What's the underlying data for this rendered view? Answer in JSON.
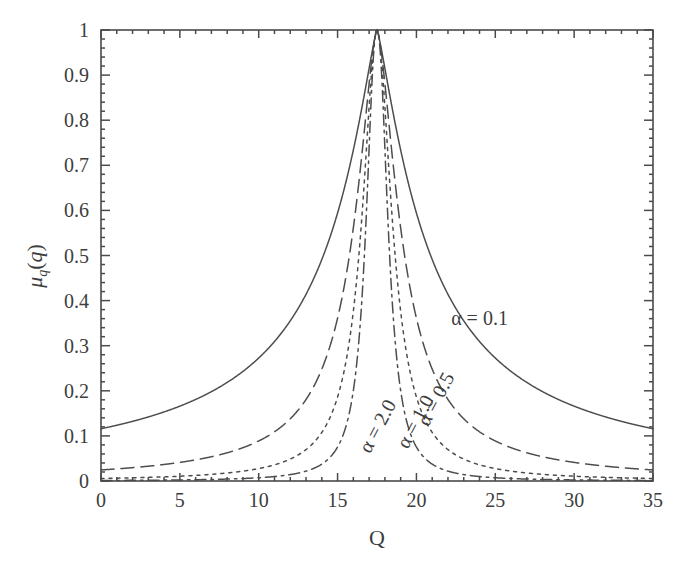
{
  "figure": {
    "background_color": "#ffffff",
    "line_color": "#4d4d4d",
    "axis_color": "#4a4a4a",
    "text_color": "#3d3d3d"
  },
  "chart_data": {
    "type": "line",
    "title": "",
    "subtitle": "",
    "xlabel": "Q",
    "ylabel": "μₐ(q)",
    "ylabel_display": "μ_q(q)",
    "xlim": [
      0,
      35
    ],
    "ylim": [
      0,
      1
    ],
    "grid": false,
    "legend_position": "inline-annotations",
    "xticks": [
      0,
      5,
      10,
      15,
      20,
      25,
      30,
      35
    ],
    "xtick_labels": [
      "0",
      "5",
      "10",
      "15",
      "20",
      "25",
      "30",
      "35"
    ],
    "xminor_step": 1,
    "yticks": [
      0,
      0.1,
      0.2,
      0.3,
      0.4,
      0.5,
      0.6,
      0.7,
      0.8,
      0.9,
      1
    ],
    "ytick_labels": [
      "0",
      "0.1",
      "0.2",
      "0.3",
      "0.4",
      "0.5",
      "0.6",
      "0.7",
      "0.8",
      "0.9",
      "1"
    ],
    "yminor_step": 0.02,
    "peak_x": 17.5,
    "function": "mu_q(Q) = 1 / (1 + ((Q - c) / w)^(2*alpha_exp))",
    "series": [
      {
        "name": "α = 0.1",
        "alpha": 0.1,
        "center": 17.5,
        "halfwidth": 3.4,
        "shape_exponent": 0.62,
        "linestyle": "solid",
        "dasharray": "",
        "label": "α = 0.1",
        "label_x": 24.0,
        "label_y": 0.345,
        "label_rotation": 0,
        "points_x": [
          0,
          1,
          2,
          3,
          4,
          5,
          6,
          7,
          8,
          9,
          10,
          11,
          12,
          13,
          14,
          15,
          16,
          17,
          17.5,
          18,
          19,
          20,
          21,
          22,
          23,
          24,
          25,
          26,
          27,
          28,
          29,
          30,
          31,
          32,
          33,
          34,
          35
        ],
        "points_y": [
          0.037,
          0.04,
          0.044,
          0.048,
          0.053,
          0.059,
          0.066,
          0.075,
          0.086,
          0.101,
          0.12,
          0.147,
          0.185,
          0.244,
          0.338,
          0.49,
          0.718,
          0.944,
          1.0,
          0.944,
          0.718,
          0.49,
          0.338,
          0.244,
          0.185,
          0.147,
          0.12,
          0.101,
          0.086,
          0.075,
          0.066,
          0.059,
          0.053,
          0.048,
          0.044,
          0.04,
          0.037
        ]
      },
      {
        "name": "α = 0.5",
        "alpha": 0.5,
        "center": 17.5,
        "halfwidth": 1.75,
        "shape_exponent": 0.8,
        "linestyle": "dashed",
        "dasharray": "13,7",
        "label": "α = 0.5",
        "label_x": 21.6,
        "label_y": 0.175,
        "label_rotation": -62,
        "points_x": [
          0,
          2,
          4,
          6,
          8,
          10,
          11,
          12,
          13,
          14,
          15,
          16,
          17,
          17.5,
          18,
          19,
          20,
          21,
          22,
          23,
          24,
          25,
          27,
          29,
          31,
          33,
          35
        ],
        "points_y": [
          0.006,
          0.007,
          0.009,
          0.011,
          0.015,
          0.023,
          0.029,
          0.039,
          0.055,
          0.083,
          0.139,
          0.266,
          0.62,
          1.0,
          0.62,
          0.266,
          0.139,
          0.083,
          0.055,
          0.039,
          0.029,
          0.023,
          0.015,
          0.011,
          0.009,
          0.007,
          0.006
        ]
      },
      {
        "name": "α = 1.0",
        "alpha": 1.0,
        "center": 17.5,
        "halfwidth": 1.15,
        "shape_exponent": 0.95,
        "linestyle": "dotted",
        "dasharray": "3,5",
        "label": "α = 1.0",
        "label_x": 20.3,
        "label_y": 0.125,
        "label_rotation": -62,
        "points_x": [
          0,
          3,
          6,
          9,
          12,
          13,
          14,
          15,
          16,
          17,
          17.5,
          18,
          19,
          20,
          21,
          22,
          23,
          26,
          29,
          32,
          35
        ],
        "points_y": [
          0.002,
          0.003,
          0.004,
          0.006,
          0.014,
          0.019,
          0.029,
          0.048,
          0.093,
          0.3,
          1.0,
          0.3,
          0.093,
          0.048,
          0.029,
          0.019,
          0.014,
          0.006,
          0.004,
          0.003,
          0.002
        ]
      },
      {
        "name": "α = 2.0",
        "alpha": 2.0,
        "center": 17.5,
        "halfwidth": 0.8,
        "shape_exponent": 1.1,
        "linestyle": "dash-dot",
        "dasharray": "11,5,2.5,5",
        "label": "α = 2.0",
        "label_x": 17.9,
        "label_y": 0.115,
        "label_rotation": -62,
        "points_x": [
          0,
          4,
          8,
          11,
          13,
          14,
          15,
          16,
          17,
          17.5,
          18,
          19,
          20,
          21,
          22,
          24,
          27,
          31,
          35
        ],
        "points_y": [
          0.001,
          0.001,
          0.002,
          0.004,
          0.009,
          0.014,
          0.024,
          0.05,
          0.19,
          1.0,
          0.19,
          0.05,
          0.024,
          0.014,
          0.009,
          0.004,
          0.002,
          0.001,
          0.001
        ]
      }
    ]
  },
  "plot_geometry": {
    "left": 101,
    "right": 653,
    "top": 30,
    "bottom": 481
  }
}
